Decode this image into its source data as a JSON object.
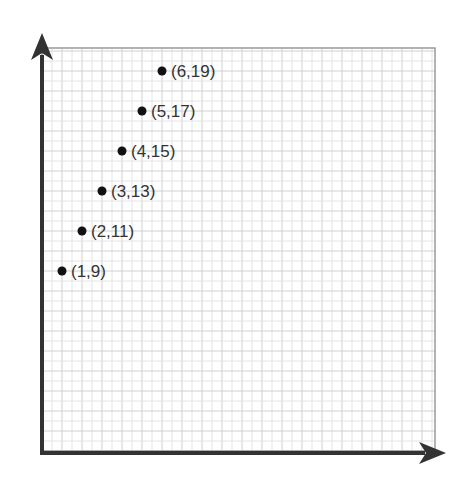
{
  "chart_data": {
    "type": "scatter",
    "title": "",
    "xlabel": "",
    "ylabel": "",
    "grid": true,
    "xlim": [
      0,
      19.6
    ],
    "ylim": [
      0,
      20.1
    ],
    "points": [
      {
        "x": 1,
        "y": 9,
        "label": "(1,9)"
      },
      {
        "x": 2,
        "y": 11,
        "label": "(2,11)"
      },
      {
        "x": 3,
        "y": 13,
        "label": "(3,13)"
      },
      {
        "x": 4,
        "y": 15,
        "label": "(4,15)"
      },
      {
        "x": 5,
        "y": 17,
        "label": "(5,17)"
      },
      {
        "x": 6,
        "y": 19,
        "label": "(6,19)"
      }
    ]
  },
  "colors": {
    "axis": "#333333",
    "grid_fine": "#e4e4e4",
    "grid_major": "#d0d0d0",
    "border": "#9a9a9a",
    "point": "#111111",
    "label": "#333333"
  }
}
